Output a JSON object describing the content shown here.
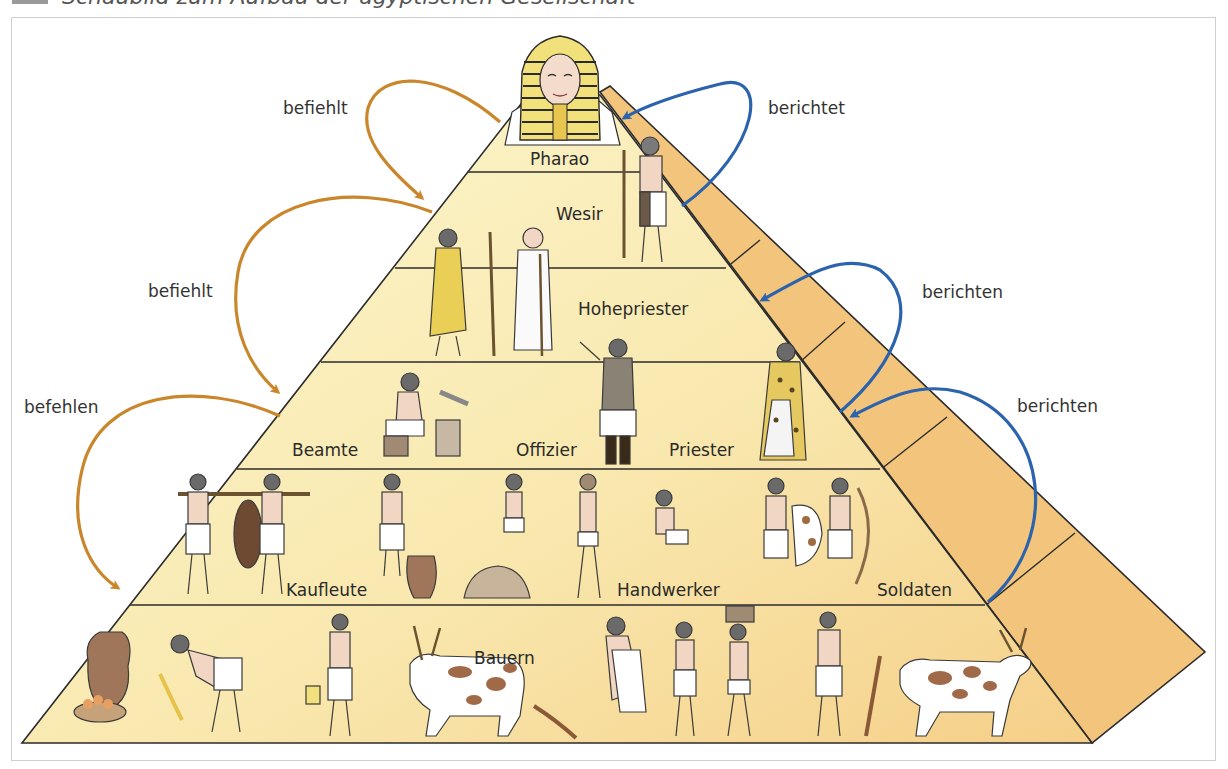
{
  "title": {
    "text": "Schaubild zum Aufbau der ägyptischen Gesellschaft"
  },
  "colors": {
    "command_arrow": "#c9862a",
    "report_arrow": "#2b63ad",
    "front_top": "#fbf4c8",
    "front_bottom": "#f6d48d",
    "side_face": "#f3c47c",
    "outline": "#2b2b2b"
  },
  "levels": [
    {
      "id": "pharao",
      "labels": [
        "Pharao"
      ]
    },
    {
      "id": "wesir",
      "labels": [
        "Wesir"
      ]
    },
    {
      "id": "hohepriester",
      "labels": [
        "Hohepriester"
      ]
    },
    {
      "id": "beamte-offizier-priester",
      "labels": [
        "Beamte",
        "Offizier",
        "Priester"
      ]
    },
    {
      "id": "kaufleute-handwerker-soldaten",
      "labels": [
        "Kaufleute",
        "Handwerker",
        "Soldaten"
      ]
    },
    {
      "id": "bauern",
      "labels": [
        "Bauern"
      ]
    }
  ],
  "relations": {
    "left": [
      {
        "label": "befiehlt",
        "from": "Pharao",
        "to": "Wesir"
      },
      {
        "label": "befiehlt",
        "from": "Wesir",
        "to": "Beamte/Offizier/Priester"
      },
      {
        "label": "befehlen",
        "from": "Beamte/Offizier/Priester",
        "to": "Bauern"
      }
    ],
    "right": [
      {
        "label": "berichtet",
        "from": "Wesir",
        "to": "Pharao"
      },
      {
        "label": "berichten",
        "from": "Beamte/Offizier/Priester",
        "to": "Hohepriester"
      },
      {
        "label": "berichten",
        "from": "Kaufleute/Handwerker/Soldaten",
        "to": "Beamte/Offizier/Priester"
      }
    ]
  },
  "figures": [
    "pharaoh-bust",
    "wesir-figure",
    "official-figure",
    "bald-priest-figure",
    "scribe-figure",
    "officer-figure",
    "priest-figure",
    "porter-figures",
    "merchant-figure",
    "craftsman-figures",
    "soldier-figures",
    "farmer-figures",
    "cattle-figures"
  ]
}
